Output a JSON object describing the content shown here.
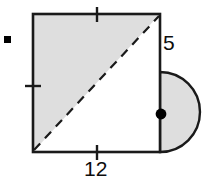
{
  "figure": {
    "colors": {
      "outline": "#1a1a1a",
      "shaded_fill": "#dedede",
      "unshaded_fill": "#ffffff",
      "dot": "#000000",
      "background": "#ffffff",
      "label_text": "#0d0d0d"
    },
    "labels": {
      "right_side": "5",
      "bottom_side": "12"
    },
    "marks": {
      "tick_top_label": "tick-mark-top-edge",
      "tick_left_label": "tick-mark-left-edge",
      "tick_bottom_label": "tick-mark-bottom-edge",
      "point_label": "semicircle-diameter-midpoint"
    },
    "geometry": {
      "square": {
        "x": 33,
        "y": 14,
        "width": 127,
        "height": 138
      },
      "diagonal": {
        "x1": 33,
        "y1": 152,
        "x2": 160,
        "y2": 14,
        "style": "dashed"
      },
      "semicircle": {
        "cx": 160,
        "cy": 112,
        "r": 40,
        "orientation": "right"
      },
      "dot": {
        "cx": 161,
        "cy": 114,
        "r": 5
      },
      "corner_marker": {
        "x": 4,
        "y": 36,
        "width": 7,
        "height": 7
      }
    }
  }
}
